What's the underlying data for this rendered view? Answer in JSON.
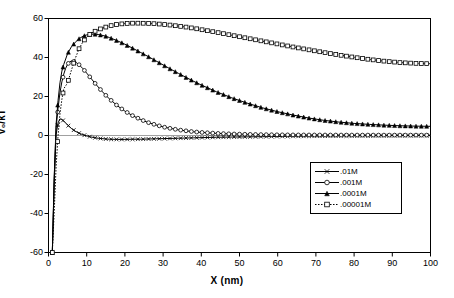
{
  "chart_data": {
    "type": "line",
    "title": "",
    "xlabel": "X (nm)",
    "ylabel": "V₀/kT",
    "xlim": [
      0,
      100
    ],
    "ylim": [
      -60,
      60
    ],
    "xticks": [
      0,
      10,
      20,
      30,
      40,
      50,
      60,
      70,
      80,
      90,
      100
    ],
    "yticks": [
      -60,
      -40,
      -20,
      0,
      20,
      40,
      60
    ],
    "grid": false,
    "zero_line": true,
    "legend_position": "lower-right",
    "series": [
      {
        "name": ".01M",
        "marker": "x",
        "line_style": "solid",
        "color": "#000000",
        "x": [
          1,
          1.5,
          2,
          2.5,
          3,
          3.5,
          4,
          4.5,
          5,
          6,
          7,
          8,
          9,
          10,
          11,
          12,
          13,
          14,
          15,
          16,
          18,
          20,
          22,
          24,
          26,
          28,
          30,
          32,
          34,
          36,
          38,
          40,
          44,
          48,
          52,
          56,
          60,
          64,
          68,
          72,
          76,
          80,
          84,
          88,
          92,
          96,
          100
        ],
        "y": [
          -60,
          -24,
          0.5,
          6.5,
          8.5,
          8.2,
          7.4,
          6.4,
          5.4,
          3.6,
          2.2,
          1.2,
          0.4,
          -0.2,
          -0.7,
          -1.1,
          -1.4,
          -1.6,
          -1.8,
          -1.9,
          -2.0,
          -2.0,
          -1.9,
          -1.9,
          -1.8,
          -1.7,
          -1.6,
          -1.5,
          -1.4,
          -1.3,
          -1.2,
          -1.1,
          -0.9,
          -0.8,
          -0.7,
          -0.6,
          -0.5,
          -0.4,
          -0.35,
          -0.3,
          -0.25,
          -0.2,
          -0.18,
          -0.15,
          -0.12,
          -0.1,
          -0.08
        ]
      },
      {
        "name": ".001M",
        "marker": "circle",
        "line_style": "solid",
        "color": "#000000",
        "x": [
          1,
          1.5,
          2,
          2.5,
          3,
          3.5,
          4,
          4.5,
          5,
          5.5,
          6,
          7,
          8,
          9,
          10,
          11,
          12,
          13,
          14,
          15,
          16,
          18,
          20,
          22,
          24,
          26,
          28,
          30,
          32,
          34,
          36,
          38,
          40,
          44,
          48,
          52,
          56,
          60,
          64,
          68,
          72,
          76,
          80,
          84,
          88,
          92,
          96,
          100
        ],
        "y": [
          -60,
          -22,
          4,
          14,
          22,
          27.5,
          31.5,
          34.5,
          36.5,
          37.7,
          38.2,
          37.8,
          36.3,
          34.3,
          32.0,
          29.6,
          27.2,
          24.9,
          22.7,
          20.6,
          18.7,
          15.3,
          12.5,
          10.2,
          8.3,
          6.7,
          5.5,
          4.4,
          3.6,
          2.9,
          2.4,
          1.9,
          1.6,
          1.1,
          0.8,
          0.6,
          0.45,
          0.35,
          0.3,
          0.27,
          0.25,
          0.23,
          0.22,
          0.21,
          0.2,
          0.2,
          0.2,
          0.2
        ]
      },
      {
        "name": ".0001M",
        "marker": "triangle",
        "line_style": "solid",
        "color": "#000000",
        "x": [
          1,
          1.5,
          2,
          2.5,
          3,
          3.5,
          4,
          5,
          6,
          7,
          8,
          9,
          10,
          11,
          12,
          13,
          14,
          15,
          16,
          18,
          20,
          22,
          24,
          26,
          28,
          30,
          32,
          34,
          36,
          38,
          40,
          44,
          48,
          52,
          56,
          60,
          64,
          68,
          72,
          76,
          80,
          84,
          88,
          92,
          96,
          100
        ],
        "y": [
          -60,
          -21,
          6,
          18,
          27,
          33,
          36.5,
          42,
          45.5,
          47.8,
          49.6,
          50.9,
          51.6,
          51.9,
          52.0,
          51.8,
          51.4,
          50.9,
          50.2,
          48.6,
          46.8,
          44.8,
          42.7,
          40.6,
          38.4,
          36.2,
          34.0,
          31.9,
          29.8,
          27.8,
          25.9,
          22.4,
          19.3,
          16.6,
          14.2,
          12.2,
          10.5,
          9.0,
          7.8,
          6.9,
          6.2,
          5.7,
          5.3,
          5.0,
          4.8,
          4.7
        ]
      },
      {
        "name": ".00001M",
        "marker": "square",
        "line_style": "dotted",
        "color": "#000000",
        "x": [
          1,
          1.5,
          2,
          2.5,
          3,
          3.5,
          4,
          5,
          6,
          7,
          8,
          9,
          10,
          11,
          12,
          14,
          16,
          18,
          20,
          22,
          24,
          26,
          28,
          30,
          32,
          34,
          36,
          38,
          40,
          44,
          48,
          52,
          56,
          60,
          64,
          68,
          72,
          76,
          80,
          84,
          88,
          92,
          96,
          100
        ],
        "y": [
          -60,
          -39,
          -15.5,
          0,
          11,
          18.5,
          24,
          27,
          33.5,
          39.5,
          44.5,
          48,
          50.5,
          52.2,
          53.3,
          55.0,
          56.2,
          57.0,
          57.4,
          57.6,
          57.6,
          57.5,
          57.3,
          57.0,
          56.6,
          56.1,
          55.6,
          55.0,
          54.3,
          52.9,
          51.4,
          49.9,
          48.4,
          46.9,
          45.4,
          44.0,
          42.6,
          41.3,
          40.1,
          39.0,
          38.1,
          37.4,
          37.0,
          36.8
        ]
      }
    ]
  },
  "legend": {
    "items": [
      {
        "label": ".01M",
        "marker": "x",
        "style": "solid"
      },
      {
        "label": ".001M",
        "marker": "circle",
        "style": "solid"
      },
      {
        "label": ".0001M",
        "marker": "triangle",
        "style": "solid"
      },
      {
        "label": ".00001M",
        "marker": "square",
        "style": "dotted"
      }
    ]
  },
  "axes": {
    "x_title": "X (nm)",
    "y_title": "V₀/kT",
    "x_tick_labels": [
      "0",
      "10",
      "20",
      "30",
      "40",
      "50",
      "60",
      "70",
      "80",
      "90",
      "100"
    ],
    "y_tick_labels": [
      "-60",
      "-40",
      "-20",
      "0",
      "20",
      "40",
      "60"
    ]
  }
}
